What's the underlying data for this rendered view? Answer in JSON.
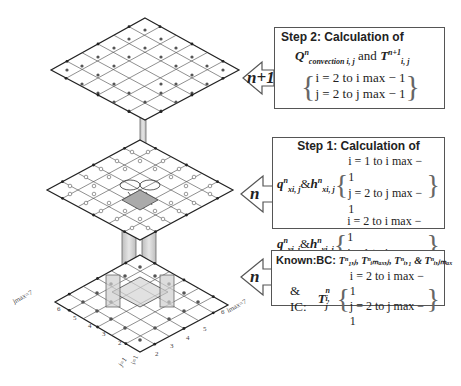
{
  "time_levels": {
    "top": "n+1",
    "middle": "n",
    "bottom": "n"
  },
  "step2": {
    "title": "Step 2: Calculation of",
    "quantity_q": "Q",
    "q_sup": "n",
    "q_sub": "convection i, j",
    "and": "and",
    "quantity_t": "T",
    "t_sup": "n+1",
    "t_sub": "i, j",
    "range_i": "i = 2 to i max − 1",
    "range_j": "j = 2 to j max − 1"
  },
  "step1": {
    "title": "Step 1: Calculation of",
    "x_flux": "q",
    "x_flux_sup": "n",
    "x_flux_sub": "xi, j",
    "x_h": "h",
    "x_h_sup": "n",
    "x_h_sub": "xi, j",
    "x_range_i": "i = 1 to i max − 1",
    "x_range_j": "j = 2 to j max − 1",
    "y_flux": "q",
    "y_flux_sup": "n",
    "y_flux_sub": "yi, j",
    "y_h": "h",
    "y_h_sup": "n",
    "y_h_sub": "yi, j",
    "y_range_i": "i = 2 to i max − 1",
    "y_range_j": "j = 1 to j max − 1",
    "amp": "&"
  },
  "known": {
    "bc_label": "Known:BC:",
    "bc_terms": "Tⁿ₁,ⱼ, Tⁿᵢₘₐₓ,ⱼ, Tⁿᵢ,₁ & Tⁿᵢ,ⱼₘₐₓ",
    "ic_label": "& IC:",
    "ic_term": "T",
    "ic_sup": "n",
    "ic_sub": "i, j",
    "range_i": "i = 2 to i max − 1",
    "range_j": "j = 2 to j max − 1"
  },
  "grid_axes": {
    "j_label": "jmax=7",
    "i_label": "imax=7",
    "j_ticks": [
      "j=1",
      "2",
      "3",
      "4",
      "5",
      "6"
    ],
    "i_ticks": [
      "i=1",
      "2",
      "3",
      "4",
      "5",
      "6"
    ]
  },
  "colors": {
    "line": "#333333",
    "grid": "#555555",
    "pillar": "#c8c8c8",
    "box_border": "#555555"
  }
}
